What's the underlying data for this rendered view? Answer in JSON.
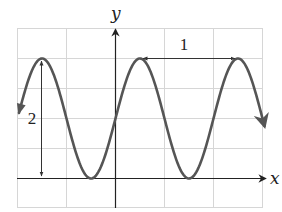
{
  "axes": {
    "x_label": "x",
    "y_label": "y"
  },
  "annotations": {
    "period_label": "1",
    "amplitude_label": "2"
  },
  "colors": {
    "curve": "#555555",
    "axis": "#222222",
    "grid": "#d6d6d6",
    "annotation": "#333333"
  },
  "chart_data": {
    "type": "line",
    "title": "",
    "xlabel": "x",
    "ylabel": "y",
    "function": "y = 1 + sin(2*pi*x)",
    "period": 1,
    "peak_to_trough_height": 2,
    "min": 0,
    "max": 2,
    "midline": 1,
    "grid": true,
    "grid_step_x": 0.5,
    "grid_step_y": 0.5,
    "xlim": [
      -2,
      3
    ],
    "ylim": [
      -0.5,
      2.5
    ],
    "annotations": [
      {
        "text": "1",
        "type": "horizontal double arrow between consecutive peaks",
        "from_x": 0.25,
        "to_x": 1.25,
        "y": 2
      },
      {
        "text": "2",
        "type": "vertical double arrow from x-axis to peak",
        "x": -0.75,
        "from_y": 0,
        "to_y": 2
      }
    ],
    "key_points": [
      {
        "x": -0.75,
        "y": 2,
        "kind": "peak"
      },
      {
        "x": -0.25,
        "y": 0,
        "kind": "trough"
      },
      {
        "x": 0,
        "y": 1,
        "kind": "y-intercept"
      },
      {
        "x": 0.25,
        "y": 2,
        "kind": "peak"
      },
      {
        "x": 0.75,
        "y": 0,
        "kind": "trough"
      },
      {
        "x": 1.25,
        "y": 2,
        "kind": "peak"
      }
    ]
  }
}
